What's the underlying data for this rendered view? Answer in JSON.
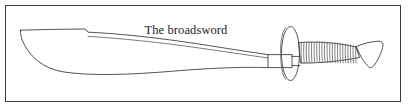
{
  "figure": {
    "caption": "The broadsword",
    "illustration_name": "broadsword-line-drawing",
    "style": "line-art",
    "colors": {
      "background": "#ffffff",
      "frame_border": "#3a3a3c",
      "outline": "#404046",
      "detail_line": "#5a5a60",
      "caption_text": "#1c1c1e"
    },
    "parts": [
      {
        "name": "blade",
        "label": "Blade",
        "description": "Long single-edged curved blade with sharp upswept point at the left, a stepped notch on the spine, and a deep belly on the cutting edge"
      },
      {
        "name": "fuller",
        "label": "Fuller",
        "description": "Narrow groove line running along the length of the blade parallel to the spine"
      },
      {
        "name": "ricasso",
        "label": "Ricasso",
        "description": "Straight rectangular blade base passing through the guard"
      },
      {
        "name": "guard",
        "label": "Guard",
        "description": "Oval disc-shaped hand guard shown in three-quarter perspective with an inner rim arc"
      },
      {
        "name": "grip",
        "label": "Grip",
        "description": "Gently curved handle bound with a tight cord wrapping of 22 coils"
      },
      {
        "name": "pommel",
        "label": "Pommel",
        "description": "Flared trumpet-shaped end cap at the right end of the grip"
      }
    ],
    "grip_wrap_count": 22
  }
}
